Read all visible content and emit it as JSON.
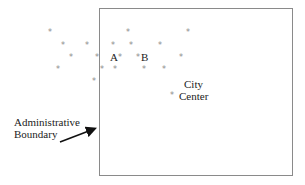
{
  "diagram": {
    "boundary_label_line1": "Administrative",
    "boundary_label_line2": "Boundary",
    "point_a_label": "A",
    "point_b_label": "B",
    "city_center_line1": "City",
    "city_center_line2": "Center",
    "marker_symbol": "*",
    "colors": {
      "boundary": "#8a8a8a",
      "marker": "#8a8a8a",
      "text": "#222222"
    },
    "points": [
      {
        "x": 50,
        "y": 33
      },
      {
        "x": 128,
        "y": 33
      },
      {
        "x": 188,
        "y": 33
      },
      {
        "x": 63,
        "y": 46
      },
      {
        "x": 87,
        "y": 46
      },
      {
        "x": 113,
        "y": 46
      },
      {
        "x": 131,
        "y": 46
      },
      {
        "x": 160,
        "y": 46
      },
      {
        "x": 71,
        "y": 58
      },
      {
        "x": 97,
        "y": 58
      },
      {
        "x": 120,
        "y": 58
      },
      {
        "x": 138,
        "y": 58
      },
      {
        "x": 181,
        "y": 58
      },
      {
        "x": 58,
        "y": 70
      },
      {
        "x": 102,
        "y": 70
      },
      {
        "x": 115,
        "y": 70
      },
      {
        "x": 144,
        "y": 70
      },
      {
        "x": 164,
        "y": 70
      },
      {
        "x": 94,
        "y": 82
      },
      {
        "x": 172,
        "y": 96
      }
    ]
  }
}
